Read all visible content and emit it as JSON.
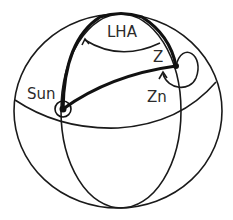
{
  "diagram": {
    "labels": {
      "lha": "LHA",
      "zenith": "Z",
      "azimuth": "Zn",
      "sun": "Sun"
    },
    "colors": {
      "line": "#1a1a1a",
      "text": "#2b2b2b",
      "background": "#ffffff"
    },
    "points": [
      "Sun",
      "Z"
    ],
    "arcs": [
      "LHA",
      "Zn"
    ]
  }
}
